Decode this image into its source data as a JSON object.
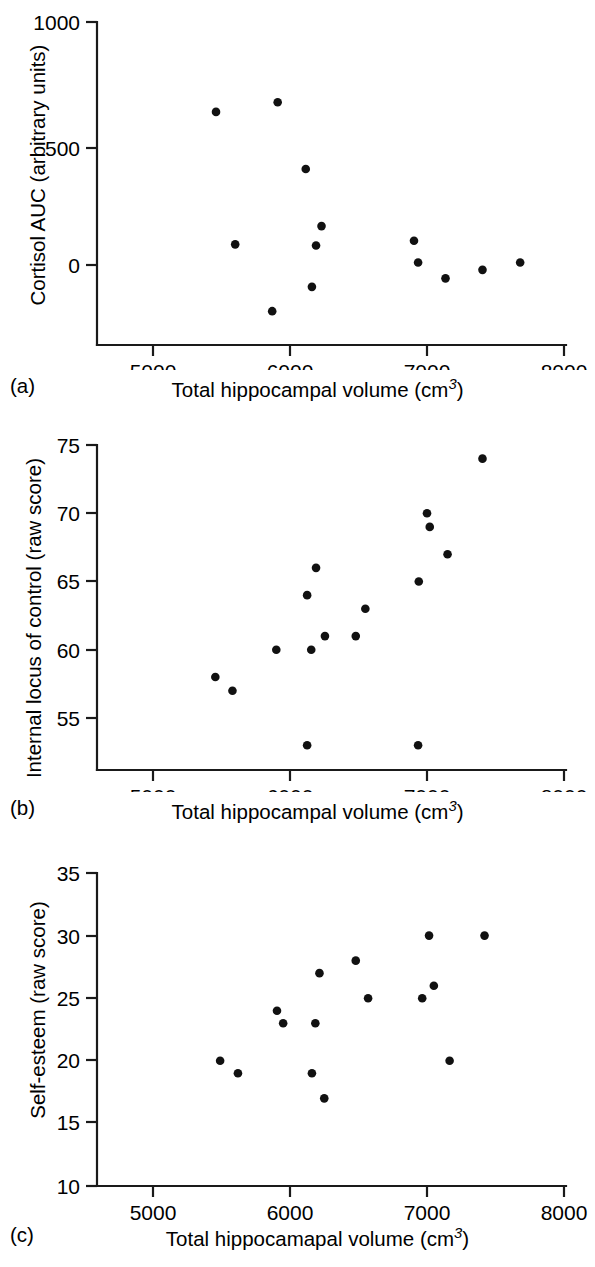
{
  "figure": {
    "background": "#ffffff",
    "marker_color": "#111111",
    "axis_color": "#1a1a1a"
  },
  "panels": [
    {
      "letter": "(a)",
      "xlabel_prefix": "Total hippocampal volume (cm",
      "xlabel_exponent": "3",
      "xlabel_suffix": ")",
      "ylabel": "Cortisol AUC (arbitrary units)"
    },
    {
      "letter": "(b)",
      "xlabel_prefix": "Total hippocampal volume (cm",
      "xlabel_exponent": "3",
      "xlabel_suffix": ")",
      "ylabel": "Internal locus of control (raw score)"
    },
    {
      "letter": "(c)",
      "xlabel_prefix": "Total hippocamapal volume (cm",
      "xlabel_exponent": "3",
      "xlabel_suffix": ")",
      "ylabel": "Self-esteem (raw score)"
    }
  ],
  "chart_data": [
    {
      "type": "scatter",
      "panel": "a",
      "title": "",
      "xlabel": "Total hippocampal volume (cm3)",
      "ylabel": "Cortisol AUC (arbitrary units)",
      "xlim": [
        4600,
        8100
      ],
      "ylim": [
        -280,
        1000
      ],
      "xticks": [
        5000,
        6000,
        7000,
        8000
      ],
      "xtick_labels": [
        "5000",
        "6000",
        "7000",
        "8000"
      ],
      "yticks": [
        0,
        500,
        1000
      ],
      "ytick_labels": [
        "0",
        "500",
        "1000"
      ],
      "grid": false,
      "legend": null,
      "x": [
        5460,
        5910,
        6115,
        6230,
        5600,
        6190,
        6160,
        5870,
        6905,
        6935,
        7135,
        7405,
        7680
      ],
      "y": [
        630,
        670,
        395,
        160,
        85,
        80,
        -90,
        -190,
        100,
        10,
        -55,
        -20,
        10
      ]
    },
    {
      "type": "scatter",
      "panel": "b",
      "title": "",
      "xlabel": "Total hippocampal volume (cm3)",
      "ylabel": "Internal locus of control (raw score)",
      "xlim": [
        4600,
        8100
      ],
      "ylim": [
        51,
        75
      ],
      "xticks": [
        5000,
        6000,
        7000,
        8000
      ],
      "xtick_labels": [
        "5000",
        "6000",
        "7000",
        "8000"
      ],
      "yticks": [
        55,
        60,
        65,
        70,
        75
      ],
      "ytick_labels": [
        "55",
        "60",
        "65",
        "70",
        "75"
      ],
      "grid": false,
      "legend": null,
      "x": [
        5455,
        5580,
        5900,
        6125,
        6155,
        6190,
        6255,
        6480,
        6550,
        6940,
        7000,
        7020,
        7150,
        7405,
        6125,
        6935
      ],
      "y": [
        58,
        57,
        60,
        64,
        60,
        66,
        61,
        61,
        63,
        65,
        70,
        69,
        67,
        74,
        53,
        53
      ]
    },
    {
      "type": "scatter",
      "panel": "c",
      "title": "",
      "xlabel": "Total hippocamapal volume (cm3)",
      "ylabel": "Self-esteem (raw score)",
      "xlim": [
        4600,
        8100
      ],
      "ylim": [
        10,
        35
      ],
      "xticks": [
        5000,
        6000,
        7000,
        8000
      ],
      "xtick_labels": [
        "5000",
        "6000",
        "7000",
        "8000"
      ],
      "yticks": [
        10,
        15,
        20,
        25,
        30,
        35
      ],
      "ytick_labels": [
        "10",
        "15",
        "20",
        "25",
        "30",
        "35"
      ],
      "grid": false,
      "legend": null,
      "x": [
        5490,
        5620,
        5905,
        5950,
        6160,
        6185,
        6215,
        6250,
        6480,
        6570,
        6965,
        7015,
        7050,
        7165,
        7420
      ],
      "y": [
        20,
        19,
        24,
        23,
        19,
        23,
        27,
        17,
        28,
        25,
        25,
        30,
        26,
        20,
        30
      ]
    }
  ]
}
